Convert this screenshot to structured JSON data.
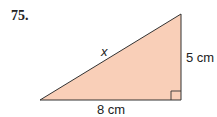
{
  "problem_number": "75.",
  "triangle": {
    "hypotenuse_label": "x",
    "vertical_leg_label": "5 cm",
    "horizontal_leg_label": "8 cm",
    "fill_color": "#f9cfb8",
    "stroke_color": "#333333",
    "right_angle": "bottom-right"
  }
}
